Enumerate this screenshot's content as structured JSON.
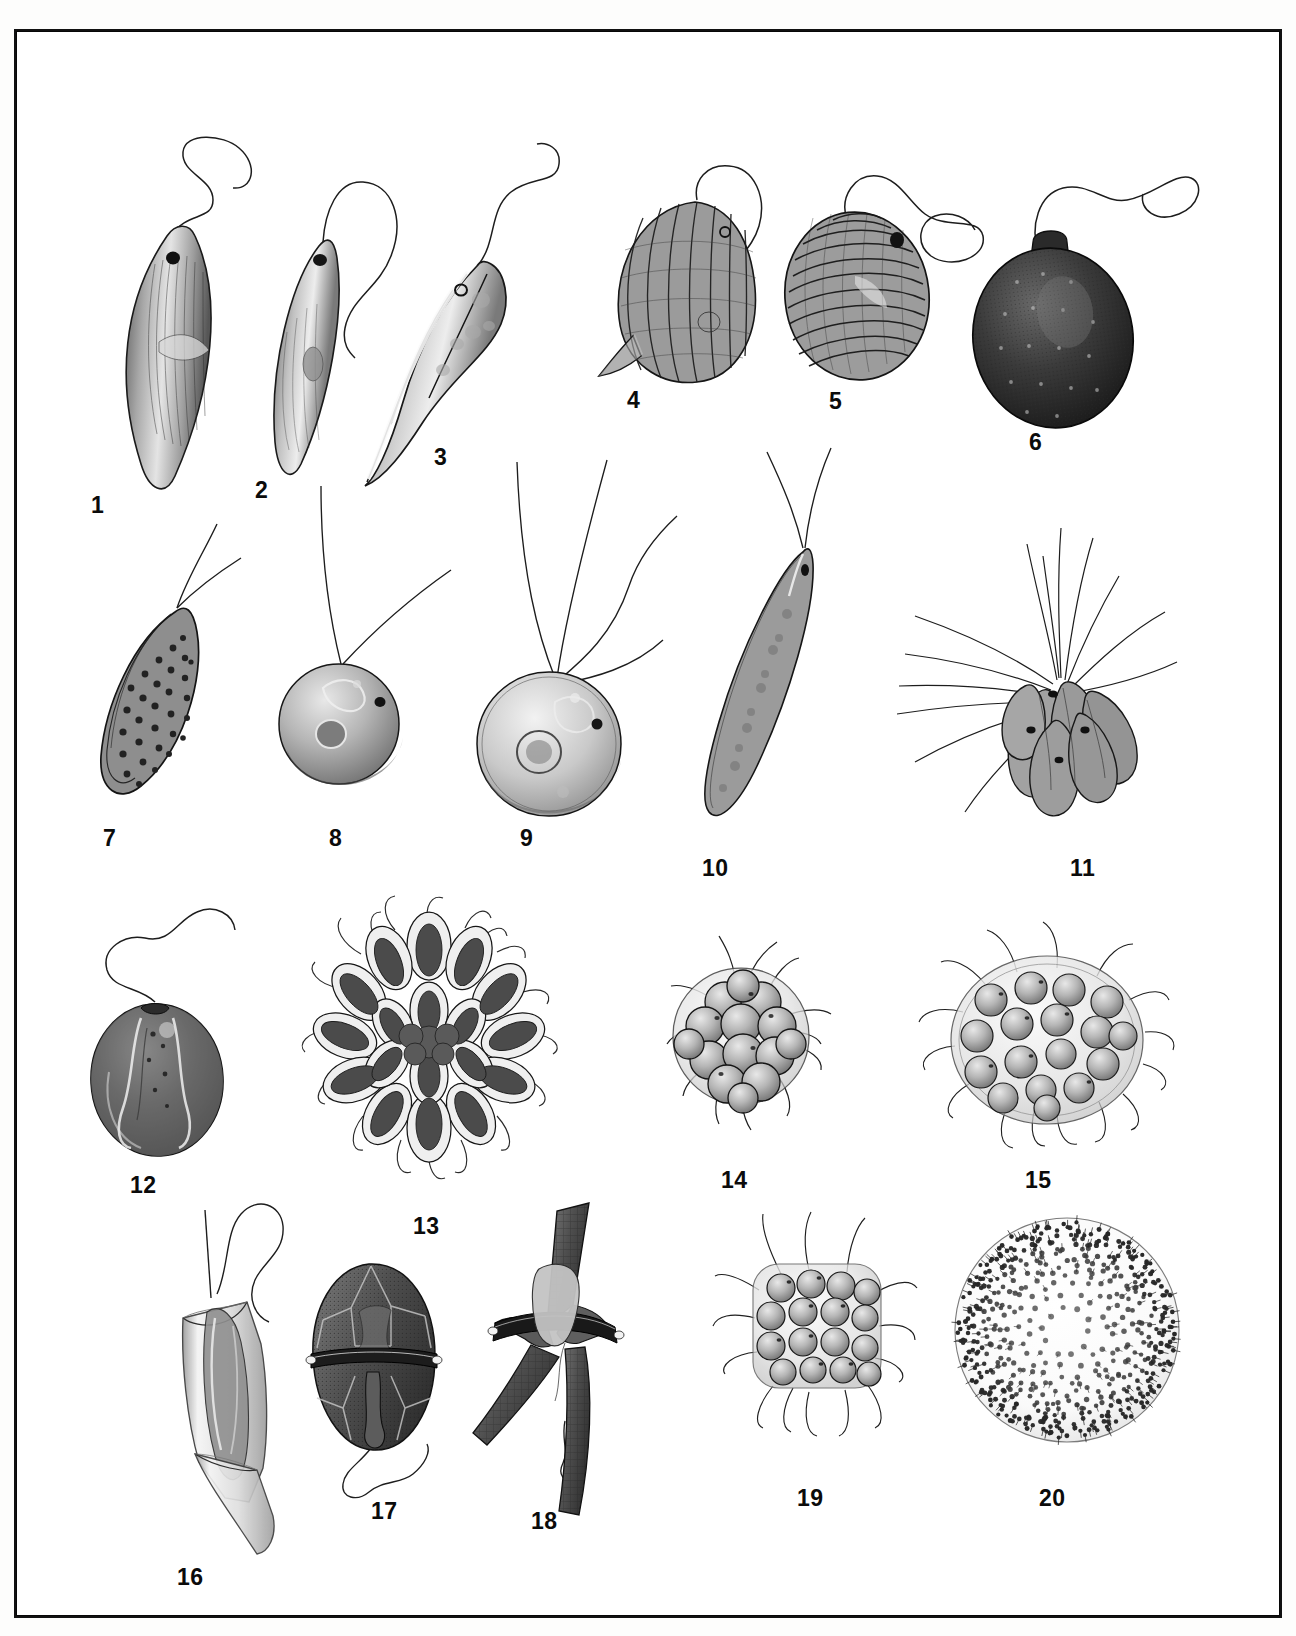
{
  "plate": {
    "kind": "scientific-illustration-plate",
    "style": "grayscale pen-and-ink with airbrush shading",
    "background_color": "#ffffff",
    "frame_color": "#111111",
    "ink_color": "#1a1a1a",
    "specimen_count": 20,
    "rows": 4
  },
  "labels": [
    {
      "n": "1",
      "x": 74,
      "y": 462
    },
    {
      "n": "2",
      "x": 238,
      "y": 447
    },
    {
      "n": "3",
      "x": 417,
      "y": 414
    },
    {
      "n": "4",
      "x": 610,
      "y": 357
    },
    {
      "n": "5",
      "x": 812,
      "y": 358
    },
    {
      "n": "6",
      "x": 1012,
      "y": 399
    },
    {
      "n": "7",
      "x": 86,
      "y": 795
    },
    {
      "n": "8",
      "x": 312,
      "y": 795
    },
    {
      "n": "9",
      "x": 503,
      "y": 795
    },
    {
      "n": "10",
      "x": 685,
      "y": 825
    },
    {
      "n": "11",
      "x": 1053,
      "y": 825
    },
    {
      "n": "12",
      "x": 113,
      "y": 1142
    },
    {
      "n": "13",
      "x": 396,
      "y": 1183
    },
    {
      "n": "14",
      "x": 704,
      "y": 1137
    },
    {
      "n": "15",
      "x": 1008,
      "y": 1137
    },
    {
      "n": "16",
      "x": 160,
      "y": 1534
    },
    {
      "n": "17",
      "x": 354,
      "y": 1468
    },
    {
      "n": "18",
      "x": 514,
      "y": 1478
    },
    {
      "n": "19",
      "x": 780,
      "y": 1455
    },
    {
      "n": "20",
      "x": 1022,
      "y": 1455
    }
  ],
  "specimens": [
    {
      "id": 1,
      "name": "euglenoid-fusiform-striated",
      "group": "euglenoid",
      "features": [
        "single anterior flagellum",
        "eyespot",
        "spiral pellicle striations",
        "fusiform tapering body"
      ],
      "x": 52,
      "y": 78,
      "w": 230,
      "h": 380,
      "tone": "#9a9a9a"
    },
    {
      "id": 2,
      "name": "euglenoid-slender-curved",
      "group": "euglenoid",
      "features": [
        "single long looping flagellum",
        "eyespot",
        "slender sickle body",
        "paramylon body"
      ],
      "x": 205,
      "y": 132,
      "w": 170,
      "h": 330,
      "tone": "#a3a3a3"
    },
    {
      "id": 3,
      "name": "euglenoid-twisted-ribbed",
      "group": "euglenoid",
      "features": [
        "single flagellum",
        "eyespot",
        "deep helical ribs",
        "drawn-out posterior tail"
      ],
      "x": 352,
      "y": 120,
      "w": 200,
      "h": 320,
      "tone": "#8f8f8f"
    },
    {
      "id": 4,
      "name": "phacus-ovoid-ridged",
      "group": "euglenoid",
      "features": [
        "single flagellum",
        "broad ovoid test",
        "longitudinal beaded ridges",
        "short caudal spine"
      ],
      "x": 565,
      "y": 135,
      "w": 190,
      "h": 230,
      "tone": "#8b8b8b"
    },
    {
      "id": 5,
      "name": "trachelomonas-lorica-spiral",
      "group": "euglenoid",
      "features": [
        "single flagellum with loop",
        "egg-shaped lorica",
        "dense spiral ornamentation",
        "eyespot"
      ],
      "x": 760,
      "y": 135,
      "w": 210,
      "h": 230,
      "tone": "#858585"
    },
    {
      "id": 6,
      "name": "trachelomonas-dark-collared",
      "group": "euglenoid",
      "features": [
        "single flagellum",
        "dark punctate lorica",
        "raised apical collar"
      ],
      "x": 940,
      "y": 120,
      "w": 230,
      "h": 270,
      "tone": "#2e2e2e"
    },
    {
      "id": 7,
      "name": "warty-ovoid-biflagellate",
      "group": "cryptomonad-like",
      "features": [
        "two apical flagella",
        "lens-shaped body",
        "coarse wart-like papillae"
      ],
      "x": 60,
      "y": 480,
      "w": 160,
      "h": 290,
      "tone": "#707070"
    },
    {
      "id": 8,
      "name": "chlamydomonad-spherical-small",
      "group": "volvocale",
      "features": [
        "two apical flagella",
        "spherical cell",
        "pyrenoid",
        "eyespot",
        "contractile vacuoles"
      ],
      "x": 235,
      "y": 440,
      "w": 190,
      "h": 330,
      "tone": "#9b9b9b"
    },
    {
      "id": 9,
      "name": "chlamydomonad-spherical-quadriflagellate",
      "group": "volvocale",
      "features": [
        "four apical flagella",
        "large spherical cell",
        "central pyrenoid",
        "eyespot"
      ],
      "x": 430,
      "y": 420,
      "w": 240,
      "h": 350,
      "tone": "#9e9e9e"
    },
    {
      "id": 10,
      "name": "chlorogonium-spindle",
      "group": "volvocale",
      "features": [
        "two apical flagella",
        "long spindle cell",
        "scattered chloroplast granules",
        "eyespot"
      ],
      "x": 645,
      "y": 415,
      "w": 170,
      "h": 375,
      "tone": "#8d8d8d"
    },
    {
      "id": 11,
      "name": "spondylomorum-colony",
      "group": "volvocale",
      "features": [
        "colony of pointed biflagellate cells",
        "many long radiating flagella",
        "eyespots"
      ],
      "x": 845,
      "y": 450,
      "w": 310,
      "h": 340,
      "tone": "#9a9a9a"
    },
    {
      "id": 12,
      "name": "cryptomonad-ovoid-furrow",
      "group": "cryptomonad",
      "features": [
        "single long wavy flagellum",
        "ovoid body",
        "ventral furrow lobes",
        "granules"
      ],
      "x": 62,
      "y": 870,
      "w": 160,
      "h": 260,
      "tone": "#767676"
    },
    {
      "id": 13,
      "name": "volvocale-colony-rosette",
      "group": "volvocale",
      "features": [
        "rosette of elongate cells",
        "mucilage envelope",
        "paired flagella on each cell"
      ],
      "x": 275,
      "y": 862,
      "w": 260,
      "h": 290,
      "tone": "#6b6b6b"
    },
    {
      "id": 14,
      "name": "pandorina-colony",
      "group": "volvocale",
      "features": [
        "sixteen packed cells",
        "spherical mucilage sheath",
        "paired flagella"
      ],
      "x": 620,
      "y": 880,
      "w": 190,
      "h": 225,
      "tone": "#8a8a8a"
    },
    {
      "id": 15,
      "name": "eudorina-colony",
      "group": "volvocale",
      "features": [
        "cells spaced in gelatinous envelope",
        "paired flagella projecting outward"
      ],
      "x": 900,
      "y": 895,
      "w": 250,
      "h": 225,
      "tone": "#929292"
    },
    {
      "id": 16,
      "name": "dinobryon-lorica-pair",
      "group": "chrysophyte",
      "features": [
        "vase-shaped lorica",
        "nested second lorica",
        "two unequal flagella",
        "chloroplast bands"
      ],
      "x": 130,
      "y": 1140,
      "w": 180,
      "h": 360,
      "tone": "#b4b4b4"
    },
    {
      "id": 17,
      "name": "peridinium-dinoflagellate",
      "group": "dinoflagellate",
      "features": [
        "armoured thecal plates",
        "cingulum girdle",
        "sulcus",
        "longitudinal flagellum"
      ],
      "x": 288,
      "y": 1228,
      "w": 140,
      "h": 215,
      "tone": "#5d5d5d"
    },
    {
      "id": 18,
      "name": "ceratium-dinoflagellate",
      "group": "dinoflagellate",
      "features": [
        "one apical horn",
        "two antapical horns",
        "reticulate theca",
        "cingulum"
      ],
      "x": 463,
      "y": 1175,
      "w": 150,
      "h": 300,
      "tone": "#5a5a5a"
    },
    {
      "id": 19,
      "name": "gonium-platycolony",
      "group": "volvocale",
      "features": [
        "flat square plate of sixteen cells",
        "mucilage pad",
        "paired flagella radiating"
      ],
      "x": 690,
      "y": 1180,
      "w": 215,
      "h": 250,
      "tone": "#8c8c8c"
    },
    {
      "id": 20,
      "name": "volvox-colony",
      "group": "volvocale",
      "features": [
        "hollow spherical colony",
        "hundreds of small biflagellate cells",
        "stippled surface"
      ],
      "x": 935,
      "y": 1175,
      "w": 235,
      "h": 250,
      "tone": "#787878"
    }
  ]
}
